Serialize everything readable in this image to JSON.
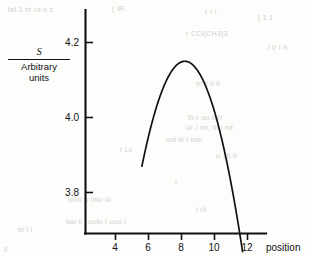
{
  "figure": {
    "name": "parabolic-signal-vs-position-plot",
    "background_color": "#fdfdfc",
    "ink_color": "#111111"
  },
  "ylabel": {
    "numerator": "S",
    "denominator_line1": "Arbitrary",
    "denominator_line2": "units"
  },
  "axis_titles": {
    "x": "position",
    "y": "S / Arbitrary units"
  },
  "ticks": {
    "y": [
      "4.2",
      "4.0",
      "3.8"
    ],
    "x": [
      "4",
      "6",
      "8",
      "10",
      "12"
    ]
  },
  "chart_data": {
    "type": "line",
    "title": "",
    "subtitle": "",
    "xlabel": "position",
    "ylabel": "S / Arbitrary units",
    "xlim": [
      3.0,
      14.0
    ],
    "ylim": [
      3.7,
      4.27
    ],
    "xticks": [
      4,
      6,
      8,
      10,
      12
    ],
    "xticklabels": [
      "4",
      "6",
      "8",
      "10",
      "12"
    ],
    "yticks": [
      4.2,
      4.0,
      3.8
    ],
    "yticklabels": [
      "4.2",
      "4.0",
      "3.8"
    ],
    "grid": false,
    "legend": null,
    "legend_position": "none",
    "annotations": [],
    "series": [
      {
        "name": "S",
        "shape": "parabola",
        "vertex": {
          "x": 8.2,
          "y": 4.15
        },
        "x": [
          5.6,
          5.9,
          6.2,
          6.5,
          6.8,
          7.1,
          7.4,
          7.7,
          8.0,
          8.2,
          8.5,
          8.8,
          9.1,
          9.4,
          9.7,
          10.0,
          10.3,
          10.6,
          10.9,
          11.2,
          11.5,
          11.7
        ],
        "y": [
          3.87,
          3.92,
          3.966,
          4.008,
          4.046,
          4.08,
          4.11,
          4.136,
          4.149,
          4.152,
          4.147,
          4.134,
          4.117,
          4.096,
          4.07,
          4.04,
          4.006,
          3.968,
          3.926,
          3.88,
          3.83,
          3.87
        ]
      }
    ]
  },
  "background_bleed": [
    {
      "text": "tel 1 hr rd u s",
      "x": 8,
      "y": 6
    },
    {
      "text": "(  IR.",
      "x": 112,
      "y": 5
    },
    {
      "text": "r  r   l",
      "x": 205,
      "y": 8
    },
    {
      "text": "] 1 1",
      "x": 258,
      "y": 14
    },
    {
      "text": "r   CCl(CH3)3",
      "x": 186,
      "y": 30
    },
    {
      "text": "l lr I h",
      "x": 268,
      "y": 44
    },
    {
      "text": "m ii  ii il",
      "x": 196,
      "y": 80
    },
    {
      "text": "lh  r  uu tun",
      "x": 188,
      "y": 114
    },
    {
      "text": "ui' i   mi, lh.i  ml",
      "x": 186,
      "y": 124
    },
    {
      "text": "uni  iii    i iuin",
      "x": 166,
      "y": 136
    },
    {
      "text": "l 1u",
      "x": 120,
      "y": 146
    },
    {
      "text": "I",
      "x": 175,
      "y": 178
    },
    {
      "text": "u  1h  il",
      "x": 216,
      "y": 152
    },
    {
      "text": "uilni   u   mlu  iu",
      "x": 68,
      "y": 196
    },
    {
      "text": "i  rii",
      "x": 196,
      "y": 206
    },
    {
      "text": "iuu ii    i  uulu l  uuu l",
      "x": 66,
      "y": 218
    },
    {
      "text": "m l  i",
      "x": 18,
      "y": 226
    },
    {
      "text": "il",
      "x": 4,
      "y": 246
    }
  ]
}
